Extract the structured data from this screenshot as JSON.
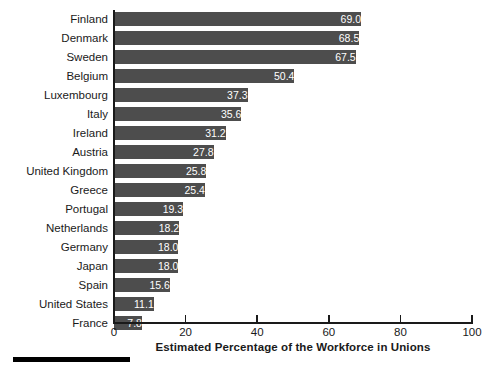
{
  "chart_data": {
    "type": "bar",
    "orientation": "horizontal",
    "title": "",
    "xlabel": "Estimated Percentage of the Workforce in Unions",
    "ylabel": "",
    "xlim": [
      0,
      100
    ],
    "xticks": [
      0,
      20,
      40,
      60,
      80,
      100
    ],
    "xtick_labels": [
      "0",
      "20",
      "40",
      "60",
      "80",
      "100"
    ],
    "grid": false,
    "legend": null,
    "bar_color": "#4d4d4d",
    "value_label_color": "#ffffff",
    "axis_color": "#1a1a1a",
    "background_color": "#ffffff",
    "categories": [
      "Finland",
      "Denmark",
      "Sweden",
      "Belgium",
      "Luxembourg",
      "Italy",
      "Ireland",
      "Austria",
      "United Kingdom",
      "Greece",
      "Portugal",
      "Netherlands",
      "Germany",
      "Japan",
      "Spain",
      "United States",
      "France"
    ],
    "values": [
      69.0,
      68.5,
      67.5,
      50.4,
      37.3,
      35.6,
      31.2,
      27.8,
      25.8,
      25.4,
      19.3,
      18.2,
      18.0,
      18.0,
      15.6,
      11.1,
      7.8
    ],
    "value_labels": [
      "69.0",
      "68.5",
      "67.5",
      "50.4",
      "37.3",
      "35.6",
      "31.2",
      "27.8",
      "25.8",
      "25.4",
      "19.3",
      "18.2",
      "18.0",
      "18.0",
      "15.6",
      "11.1",
      "7.8"
    ]
  }
}
